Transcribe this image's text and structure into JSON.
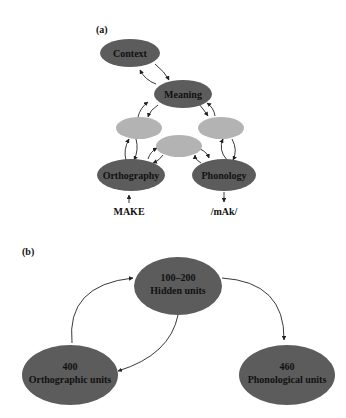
{
  "panel_a": {
    "label": "(a)",
    "nodes": {
      "context": "Context",
      "meaning": "Meaning",
      "orthography": "Orthography",
      "phonology": "Phonology"
    },
    "input_label": "MAKE",
    "output_label": "/mAk/"
  },
  "panel_b": {
    "label": "(b)",
    "hidden": {
      "count": "100–200",
      "name": "Hidden units"
    },
    "orthographic": {
      "count": "400",
      "name": "Orthographic units"
    },
    "phonological": {
      "count": "460",
      "name": "Phonological units"
    }
  },
  "colors": {
    "dark_node": "#5c5c5c",
    "light_node": "#b3b3b3",
    "arrow": "#222222"
  }
}
